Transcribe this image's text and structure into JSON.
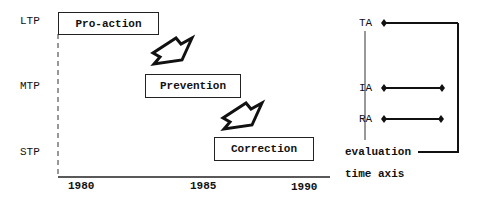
{
  "levels": {
    "ltp": "LTP",
    "mtp": "MTP",
    "stp": "STP"
  },
  "boxes": {
    "proaction": "Pro-action",
    "prevention": "Prevention",
    "correction": "Correction"
  },
  "axis": {
    "ticks": [
      "1980",
      "1985",
      "1990"
    ]
  },
  "legend": {
    "ta": "TA",
    "ia": "IA",
    "ra": "RA",
    "evaluation": "evaluation",
    "time_axis": "time axis"
  }
}
